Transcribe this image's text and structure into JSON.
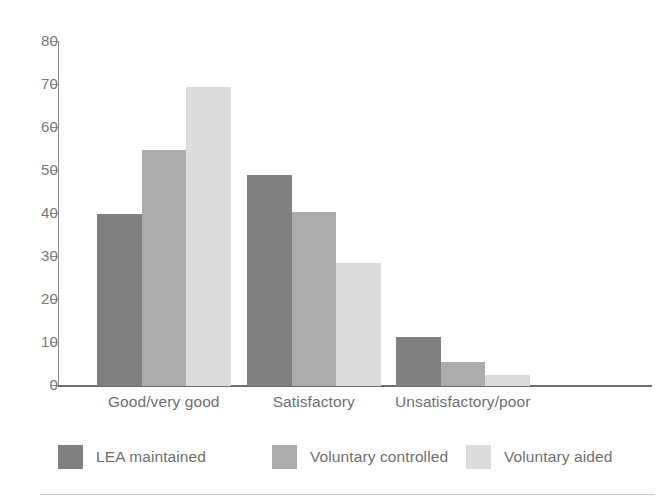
{
  "chart_data": {
    "type": "bar",
    "title": "",
    "subtitle": "",
    "xlabel": "",
    "ylabel": "",
    "categories": [
      "Good/very good",
      "Satisfactory",
      "Unsatisfactory/poor"
    ],
    "series": [
      {
        "name": "LEA maintained",
        "color": "#808080",
        "values": [
          40,
          49,
          11.5
        ]
      },
      {
        "name": "Voluntary controlled",
        "color": "#abacab",
        "values": [
          55,
          40.5,
          5.5
        ]
      },
      {
        "name": "Voluntary aided",
        "color": "#dcdcdc",
        "values": [
          69.5,
          28.5,
          2.5
        ]
      }
    ],
    "ylim": [
      0,
      80
    ],
    "yticks": [
      0,
      10,
      20,
      30,
      40,
      50,
      60,
      70,
      80
    ],
    "ytick_labels": [
      "0",
      "10",
      "20",
      "30",
      "40",
      "50",
      "60",
      "70",
      "80"
    ],
    "grid": false,
    "legend_position": "bottom",
    "axis_color": "#6f6f6f",
    "text_color": "#6f6f6f"
  }
}
